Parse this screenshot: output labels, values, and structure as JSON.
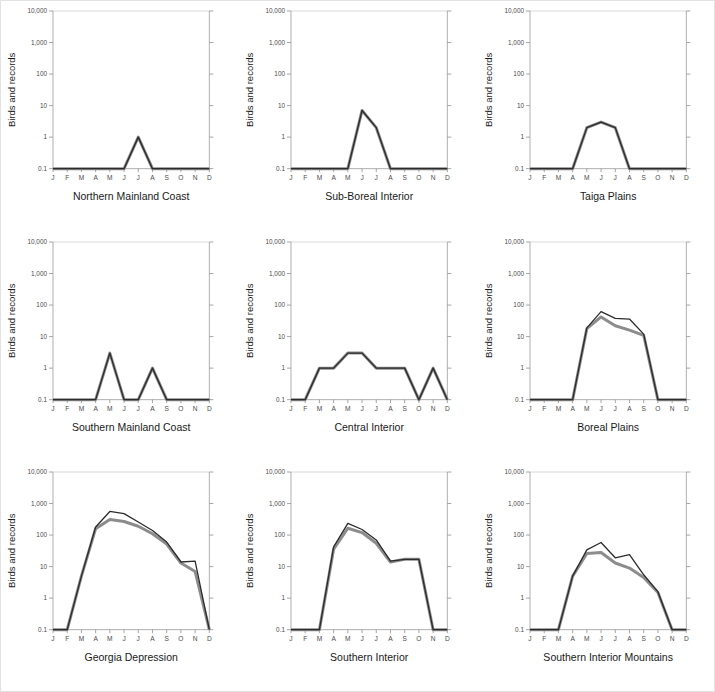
{
  "figure": {
    "title": "",
    "border_color": "#e2e2e2",
    "background": "#ffffff"
  },
  "axes": {
    "y_axis_label": "Birds and records",
    "y_tick_labels": [
      "10,000",
      "1,000",
      "100",
      "10",
      "1",
      "0.1"
    ],
    "y_tick_values": [
      10000,
      1000,
      100,
      10,
      1,
      0.1
    ],
    "x_tick_labels": [
      "J",
      "F",
      "M",
      "A",
      "M",
      "J",
      "J",
      "A",
      "S",
      "O",
      "N",
      "D"
    ],
    "axis_color": "#9b9b9b",
    "tick_color": "#8f8f8f",
    "grid": false,
    "scale": "log"
  },
  "series_styles": {
    "records": {
      "name": "records",
      "color": "#2b2b2b",
      "width": 1.3
    },
    "birds": {
      "name": "birds",
      "color": "#8c8c8c",
      "width": 3.0
    }
  },
  "chart_data": [
    {
      "type": "line",
      "title": "Northern Mainland Coast",
      "xlabel": "",
      "ylabel": "Birds and records",
      "categories": [
        "J",
        "F",
        "M",
        "A",
        "M",
        "J",
        "J",
        "A",
        "S",
        "O",
        "N",
        "D"
      ],
      "ylim": [
        0.1,
        10000
      ],
      "yscale": "log",
      "grid": false,
      "series": [
        {
          "name": "records",
          "values": [
            0.1,
            0.1,
            0.1,
            0.1,
            0.1,
            0.1,
            1,
            0.1,
            0.1,
            0.1,
            0.1,
            0.1
          ]
        },
        {
          "name": "birds",
          "values": [
            0.1,
            0.1,
            0.1,
            0.1,
            0.1,
            0.1,
            1,
            0.1,
            0.1,
            0.1,
            0.1,
            0.1
          ]
        }
      ]
    },
    {
      "type": "line",
      "title": "Sub-Boreal Interior",
      "xlabel": "",
      "ylabel": "Birds and records",
      "categories": [
        "J",
        "F",
        "M",
        "A",
        "M",
        "J",
        "J",
        "A",
        "S",
        "O",
        "N",
        "D"
      ],
      "ylim": [
        0.1,
        10000
      ],
      "yscale": "log",
      "grid": false,
      "series": [
        {
          "name": "records",
          "values": [
            0.1,
            0.1,
            0.1,
            0.1,
            0.1,
            7,
            2,
            0.1,
            0.1,
            0.1,
            0.1,
            0.1
          ]
        },
        {
          "name": "birds",
          "values": [
            0.1,
            0.1,
            0.1,
            0.1,
            0.1,
            7,
            2,
            0.1,
            0.1,
            0.1,
            0.1,
            0.1
          ]
        }
      ]
    },
    {
      "type": "line",
      "title": "Taiga Plains",
      "xlabel": "",
      "ylabel": "Birds and records",
      "categories": [
        "J",
        "F",
        "M",
        "A",
        "M",
        "J",
        "J",
        "A",
        "S",
        "O",
        "N",
        "D"
      ],
      "ylim": [
        0.1,
        10000
      ],
      "yscale": "log",
      "grid": false,
      "series": [
        {
          "name": "records",
          "values": [
            0.1,
            0.1,
            0.1,
            0.1,
            2,
            3,
            2,
            0.1,
            0.1,
            0.1,
            0.1,
            0.1
          ]
        },
        {
          "name": "birds",
          "values": [
            0.1,
            0.1,
            0.1,
            0.1,
            2,
            3,
            2,
            0.1,
            0.1,
            0.1,
            0.1,
            0.1
          ]
        }
      ]
    },
    {
      "type": "line",
      "title": "Southern Mainland Coast",
      "xlabel": "",
      "ylabel": "Birds and records",
      "categories": [
        "J",
        "F",
        "M",
        "A",
        "M",
        "J",
        "J",
        "A",
        "S",
        "O",
        "N",
        "D"
      ],
      "ylim": [
        0.1,
        10000
      ],
      "yscale": "log",
      "grid": false,
      "series": [
        {
          "name": "records",
          "values": [
            0.1,
            0.1,
            0.1,
            0.1,
            3,
            0.1,
            0.1,
            1,
            0.1,
            0.1,
            0.1,
            0.1
          ]
        },
        {
          "name": "birds",
          "values": [
            0.1,
            0.1,
            0.1,
            0.1,
            3,
            0.1,
            0.1,
            1,
            0.1,
            0.1,
            0.1,
            0.1
          ]
        }
      ]
    },
    {
      "type": "line",
      "title": "Central Interior",
      "xlabel": "",
      "ylabel": "Birds and records",
      "categories": [
        "J",
        "F",
        "M",
        "A",
        "M",
        "J",
        "J",
        "A",
        "S",
        "O",
        "N",
        "D"
      ],
      "ylim": [
        0.1,
        10000
      ],
      "yscale": "log",
      "grid": false,
      "series": [
        {
          "name": "records",
          "values": [
            0.1,
            0.1,
            1,
            1,
            3,
            3,
            1,
            1,
            1,
            0.1,
            1,
            0.1
          ]
        },
        {
          "name": "birds",
          "values": [
            0.1,
            0.1,
            1,
            1,
            3,
            3,
            1,
            1,
            1,
            0.1,
            1,
            0.1
          ]
        }
      ]
    },
    {
      "type": "line",
      "title": "Boreal Plains",
      "xlabel": "",
      "ylabel": "Birds and records",
      "categories": [
        "J",
        "F",
        "M",
        "A",
        "M",
        "J",
        "J",
        "A",
        "S",
        "O",
        "N",
        "D"
      ],
      "ylim": [
        0.1,
        10000
      ],
      "yscale": "log",
      "grid": false,
      "series": [
        {
          "name": "records",
          "values": [
            0.1,
            0.1,
            0.1,
            0.1,
            19,
            62,
            38,
            36,
            12,
            0.1,
            0.1,
            0.1
          ]
        },
        {
          "name": "birds",
          "values": [
            0.1,
            0.1,
            0.1,
            0.1,
            18,
            42,
            22,
            16,
            11,
            0.1,
            0.1,
            0.1
          ]
        }
      ]
    },
    {
      "type": "line",
      "title": "Georgia Depression",
      "xlabel": "",
      "ylabel": "Birds and records",
      "categories": [
        "J",
        "F",
        "M",
        "A",
        "M",
        "J",
        "J",
        "A",
        "S",
        "O",
        "N",
        "D"
      ],
      "ylim": [
        0.1,
        10000
      ],
      "yscale": "log",
      "grid": false,
      "series": [
        {
          "name": "records",
          "values": [
            0.1,
            0.1,
            5,
            180,
            560,
            480,
            260,
            140,
            60,
            14,
            15,
            0.1
          ]
        },
        {
          "name": "birds",
          "values": [
            0.1,
            0.1,
            5,
            160,
            310,
            270,
            190,
            110,
            52,
            13,
            7,
            0.1
          ]
        }
      ]
    },
    {
      "type": "line",
      "title": "Southern Interior",
      "xlabel": "",
      "ylabel": "Birds and records",
      "categories": [
        "J",
        "F",
        "M",
        "A",
        "M",
        "J",
        "J",
        "A",
        "S",
        "O",
        "N",
        "D"
      ],
      "ylim": [
        0.1,
        10000
      ],
      "yscale": "log",
      "grid": false,
      "series": [
        {
          "name": "records",
          "values": [
            0.1,
            0.1,
            0.1,
            42,
            235,
            150,
            70,
            15,
            17,
            17,
            0.1,
            0.1
          ]
        },
        {
          "name": "birds",
          "values": [
            0.1,
            0.1,
            0.1,
            36,
            165,
            120,
            55,
            14,
            17,
            17,
            0.1,
            0.1
          ]
        }
      ]
    },
    {
      "type": "line",
      "title": "Southern Interior Mountains",
      "xlabel": "",
      "ylabel": "Birds and records",
      "categories": [
        "J",
        "F",
        "M",
        "A",
        "M",
        "J",
        "J",
        "A",
        "S",
        "O",
        "N",
        "D"
      ],
      "ylim": [
        0.1,
        10000
      ],
      "yscale": "log",
      "grid": false,
      "series": [
        {
          "name": "records",
          "values": [
            0.1,
            0.1,
            0.1,
            5,
            34,
            58,
            19,
            24,
            5.5,
            1.6,
            0.1,
            0.1
          ]
        },
        {
          "name": "birds",
          "values": [
            0.1,
            0.1,
            0.1,
            5,
            26,
            28,
            13,
            9,
            4.5,
            1.5,
            0.1,
            0.1
          ]
        }
      ]
    }
  ]
}
